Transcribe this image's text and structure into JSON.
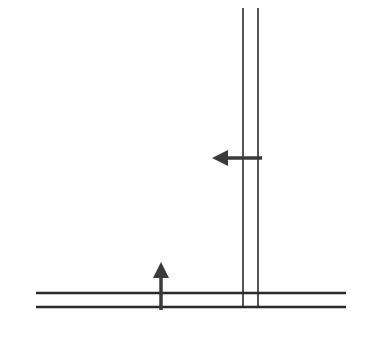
{
  "diagram": {
    "width": 372,
    "height": 343,
    "colors": {
      "background": "#ffffff",
      "line": "#2a2a2a",
      "arrow": "#3a3a3a"
    },
    "vertical_lines": [
      {
        "name": "vertical-line-left",
        "x": 243,
        "y1": 8,
        "y2": 307
      },
      {
        "name": "vertical-line-right",
        "x": 258,
        "y1": 8,
        "y2": 307
      }
    ],
    "horizontal_lines": [
      {
        "name": "horizontal-line-top",
        "y": 293,
        "x1": 36,
        "x2": 346
      },
      {
        "name": "horizontal-line-bottom",
        "y": 307,
        "x1": 36,
        "x2": 346
      }
    ],
    "arrows": [
      {
        "name": "left-arrow-icon",
        "direction": "left",
        "tail": [
          262,
          158
        ],
        "head": [
          212,
          158
        ]
      },
      {
        "name": "up-arrow-icon",
        "direction": "up",
        "tail": [
          161,
          310
        ],
        "head": [
          161,
          262
        ]
      }
    ]
  }
}
